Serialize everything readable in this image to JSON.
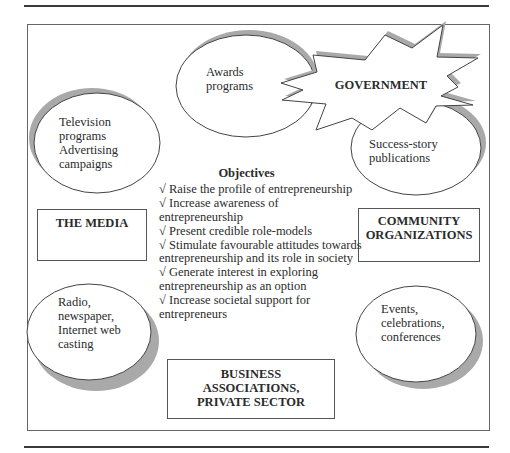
{
  "diagram": {
    "central": {
      "title": "Objectives",
      "items": [
        "√ Raise the profile of entrepreneurship",
        "√ Increase awareness of entrepreneurship",
        "√ Present credible role-models",
        "√ Stimulate favourable attitudes towards entrepreneurship and its role in society",
        "√ Generate interest in exploring entrepreneurship as an option",
        "√ Increase societal support for entrepreneurs"
      ]
    },
    "actors": {
      "government": "GOVERNMENT",
      "media": "THE MEDIA",
      "community_line1": "COMMUNITY",
      "community_line2": "ORGANIZATIONS",
      "business_line1": "BUSINESS",
      "business_line2": "ASSOCIATIONS,",
      "business_line3": "PRIVATE SECTOR"
    },
    "channels": {
      "awards": [
        "Awards",
        "programs"
      ],
      "television": [
        "Television",
        "programs",
        "Advertising",
        "campaigns"
      ],
      "success_story": [
        "Success-story",
        "publications"
      ],
      "radio": [
        "Radio,",
        "newspaper,",
        "Internet web",
        "casting"
      ],
      "events": [
        "Events,",
        "celebrations,",
        "conferences"
      ]
    },
    "colors": {
      "shadow": "#a9a9a9",
      "outline": "#444444",
      "frame": "#666666"
    }
  }
}
